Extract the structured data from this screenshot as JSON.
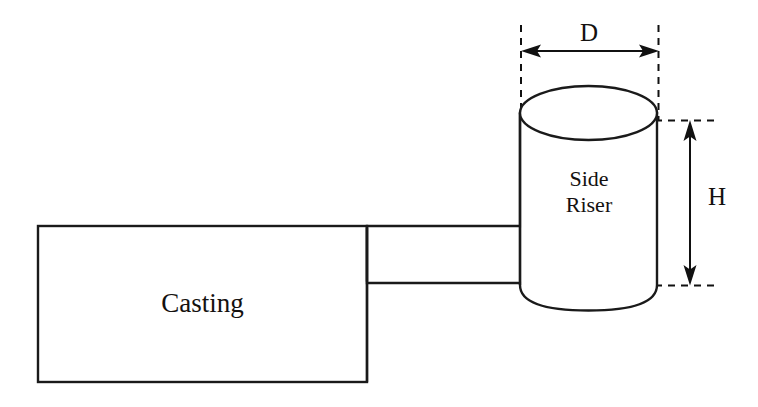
{
  "diagram": {
    "background_color": "#ffffff",
    "line_color": "#1a1a1a",
    "text_color": "#14110f",
    "labels": {
      "casting": "Casting",
      "riser_line1": "Side",
      "riser_line2": "Riser",
      "diameter": "D",
      "height": "H"
    },
    "shapes": {
      "casting_rect": {
        "name": "Casting",
        "x": 38,
        "y": 226,
        "width": 329,
        "height": 156
      },
      "neck_rect": {
        "name": "Gate / Neck",
        "x": 367,
        "y": 226,
        "width": 153,
        "height": 57
      },
      "riser_cylinder": {
        "name": "Side Riser",
        "left": 520,
        "right": 657,
        "top_ellipse_center_y": 113,
        "ellipse_ry": 27,
        "body_bottom_y": 285,
        "bottom_arc_depth": 25
      }
    },
    "dimensions": {
      "diameter": {
        "symbol": "D",
        "orientation": "horizontal",
        "line_y": 51,
        "x_start": 522,
        "x_end": 659
      },
      "height": {
        "symbol": "H",
        "orientation": "vertical",
        "line_x": 690,
        "y_start": 120,
        "y_end": 285
      }
    }
  }
}
